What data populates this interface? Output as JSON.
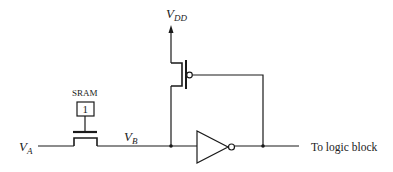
{
  "diagram": {
    "type": "circuit-schematic",
    "labels": {
      "va": "V",
      "va_sub": "A",
      "vb": "V",
      "vb_sub": "B",
      "vdd": "V",
      "vdd_sub": "DD",
      "sram": "SRAM",
      "sram_value": "1",
      "output": "To logic block"
    },
    "components": [
      {
        "id": "pass-transistor",
        "kind": "nmos",
        "gate": "sram-cell"
      },
      {
        "id": "sram-cell",
        "kind": "memory-bit",
        "value": "1"
      },
      {
        "id": "pullup-pmos",
        "kind": "pmos",
        "source": "VDD",
        "drain": "VB",
        "gate": "inverter-output"
      },
      {
        "id": "inverter",
        "kind": "inverter",
        "input": "VB",
        "output": "To logic block"
      }
    ],
    "colors": {
      "line": "#1a1a1a",
      "background": "#ffffff"
    }
  }
}
